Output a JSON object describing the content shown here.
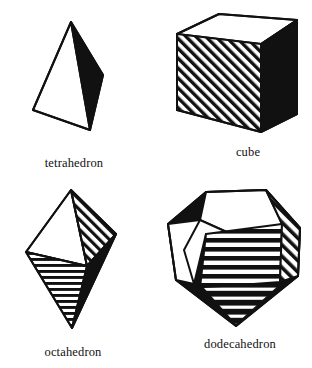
{
  "plate": {
    "title": "",
    "background_color": "#ffffff",
    "ink_color": "#111111",
    "figure_count": 4
  },
  "figures": [
    {
      "id": "tetrahedron",
      "label": "tetrahedron",
      "faces_visible": 2,
      "face_fills": [
        "white",
        "black"
      ],
      "position": "top-left"
    },
    {
      "id": "cube",
      "label": "cube",
      "faces_visible": 3,
      "face_fills": [
        "white",
        "diagonal-hatch",
        "black"
      ],
      "position": "top-right"
    },
    {
      "id": "octahedron",
      "label": "octahedron",
      "faces_visible": 4,
      "face_fills": [
        "white",
        "diagonal-hatch",
        "horizontal-hatch",
        "black"
      ],
      "position": "bottom-left"
    },
    {
      "id": "dodecahedron",
      "label": "dodecahedron",
      "faces_visible": 6,
      "face_fills": [
        "white",
        "white",
        "horizontal-hatch",
        "diagonal-hatch",
        "black",
        "black-horizontal-hatch"
      ],
      "position": "bottom-right"
    }
  ]
}
